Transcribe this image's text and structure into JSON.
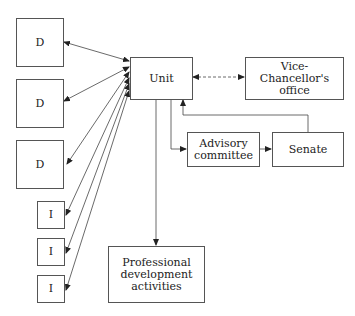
{
  "diagram": {
    "nodes": {
      "unit": "Unit",
      "vc_office": "Vice-Chancellor's office",
      "advisory": "Advisory committee",
      "senate": "Senate",
      "professional": "Professional development activities",
      "d1": "D",
      "d2": "D",
      "d3": "D",
      "i1": "I",
      "i2": "I",
      "i3": "I"
    },
    "edges": [
      {
        "from": "d1",
        "to": "unit",
        "style": "solid",
        "direction": "both"
      },
      {
        "from": "d2",
        "to": "unit",
        "style": "solid",
        "direction": "both"
      },
      {
        "from": "d3",
        "to": "unit",
        "style": "solid",
        "direction": "both"
      },
      {
        "from": "i1",
        "to": "unit",
        "style": "solid",
        "direction": "both"
      },
      {
        "from": "i2",
        "to": "unit",
        "style": "solid",
        "direction": "both"
      },
      {
        "from": "i3",
        "to": "unit",
        "style": "solid",
        "direction": "both"
      },
      {
        "from": "unit",
        "to": "vc_office",
        "style": "dashed",
        "direction": "both"
      },
      {
        "from": "unit",
        "to": "advisory",
        "style": "solid",
        "direction": "forward"
      },
      {
        "from": "advisory",
        "to": "senate",
        "style": "solid",
        "direction": "forward"
      },
      {
        "from": "senate",
        "to": "unit",
        "style": "solid",
        "direction": "forward"
      },
      {
        "from": "unit",
        "to": "professional",
        "style": "solid",
        "direction": "forward"
      }
    ]
  }
}
